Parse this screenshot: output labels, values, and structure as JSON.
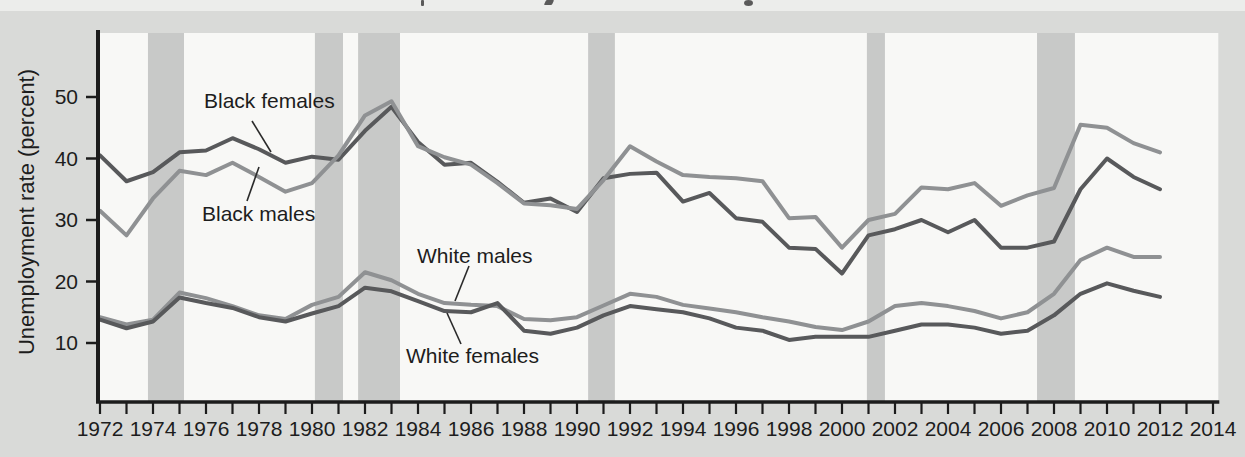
{
  "figure": {
    "interactive": false
  },
  "colors": {
    "page_bg": "#d9dad8",
    "top_strip_bg": "#ecedeb",
    "plot_bg": "#f8f8f6",
    "recession_band": "#c8c9c8",
    "series_dark": "#58595b",
    "series_medium": "#8f9193",
    "axis": "#1c1c1c",
    "text": "#1d1d1d"
  },
  "chart_data": {
    "type": "line",
    "title": "",
    "xlabel": "",
    "ylabel": "Unemployment rate (percent)",
    "grid": false,
    "legend_position": "inline-annotations",
    "ylim": [
      0,
      60
    ],
    "xlim": [
      1971.85,
      2014.2
    ],
    "y_ticks": [
      10,
      20,
      30,
      40,
      50
    ],
    "x_tick_every_years": 1,
    "x_label_years": [
      1972,
      1974,
      1976,
      1978,
      1980,
      1982,
      1984,
      1986,
      1988,
      1990,
      1992,
      1994,
      1996,
      1998,
      2000,
      2002,
      2004,
      2006,
      2008,
      2010,
      2012,
      2014
    ],
    "x_years": [
      1972,
      1973,
      1974,
      1975,
      1976,
      1977,
      1978,
      1979,
      1980,
      1981,
      1982,
      1983,
      1984,
      1985,
      1986,
      1987,
      1988,
      1989,
      1990,
      1991,
      1992,
      1993,
      1994,
      1995,
      1996,
      1997,
      1998,
      1999,
      2000,
      2001,
      2002,
      2003,
      2004,
      2005,
      2006,
      2007,
      2008,
      2009,
      2010,
      2011,
      2012
    ],
    "series": [
      {
        "name": "Black females",
        "tone": "dark",
        "values": [
          40.5,
          36.3,
          37.8,
          41.0,
          41.3,
          43.3,
          41.5,
          39.3,
          40.3,
          39.8,
          44.5,
          48.4,
          42.7,
          39.0,
          39.3,
          36.2,
          32.8,
          33.5,
          31.3,
          36.8,
          37.5,
          37.7,
          33.0,
          34.4,
          30.3,
          29.7,
          25.5,
          25.3,
          21.3,
          27.5,
          28.5,
          30.0,
          28.0,
          30.0,
          25.5,
          25.5,
          26.5,
          35.0,
          40.0,
          37.0,
          35.0
        ]
      },
      {
        "name": "Black males",
        "tone": "medium",
        "values": [
          31.5,
          27.5,
          33.5,
          38.0,
          37.3,
          39.3,
          37.0,
          34.6,
          36.0,
          40.5,
          47.0,
          49.3,
          42.0,
          40.2,
          39.0,
          36.0,
          32.7,
          32.4,
          31.8,
          36.5,
          42.0,
          39.5,
          37.3,
          37.0,
          36.8,
          36.3,
          30.3,
          30.5,
          25.5,
          30.0,
          31.0,
          35.3,
          35.0,
          36.0,
          32.3,
          34.0,
          35.2,
          45.5,
          45.0,
          42.5,
          41.0
        ]
      },
      {
        "name": "White males",
        "tone": "medium",
        "values": [
          14.2,
          13.0,
          13.8,
          18.2,
          17.3,
          16.0,
          14.5,
          13.9,
          16.2,
          17.5,
          21.5,
          20.2,
          18.0,
          16.5,
          16.2,
          16.0,
          13.9,
          13.7,
          14.2,
          16.1,
          18.0,
          17.5,
          16.2,
          15.6,
          15.0,
          14.2,
          13.5,
          12.6,
          12.1,
          13.5,
          16.0,
          16.5,
          16.0,
          15.2,
          14.0,
          15.0,
          18.0,
          23.5,
          25.5,
          24.0,
          24.0
        ]
      },
      {
        "name": "White females",
        "tone": "dark",
        "values": [
          13.8,
          12.4,
          13.5,
          17.4,
          16.5,
          15.7,
          14.2,
          13.5,
          14.8,
          16.0,
          19.0,
          18.4,
          16.8,
          15.2,
          15.0,
          16.5,
          12.0,
          11.5,
          12.5,
          14.5,
          16.0,
          15.5,
          15.0,
          14.0,
          12.5,
          12.0,
          10.5,
          11.0,
          11.0,
          11.0,
          12.0,
          13.0,
          13.0,
          12.5,
          11.5,
          12.0,
          14.5,
          18.0,
          19.7,
          18.5,
          17.5
        ]
      }
    ],
    "recession_bands_years": [
      [
        1973.81,
        1975.17
      ],
      [
        1980.11,
        1981.17
      ],
      [
        1981.74,
        1983.32
      ],
      [
        1990.42,
        1991.43
      ],
      [
        2000.94,
        2001.62
      ],
      [
        2007.36,
        2008.79
      ]
    ],
    "annotations": [
      {
        "label": "Black females",
        "leader_px": [
          252,
          121,
          271,
          152
        ]
      },
      {
        "label": "Black males",
        "leader_px": [
          247,
          201,
          259,
          167
        ]
      },
      {
        "label": "White males",
        "leader_px": [
          469,
          266,
          455,
          301
        ]
      },
      {
        "label": "White females",
        "leader_px": [
          461,
          344,
          447,
          313
        ]
      }
    ]
  }
}
